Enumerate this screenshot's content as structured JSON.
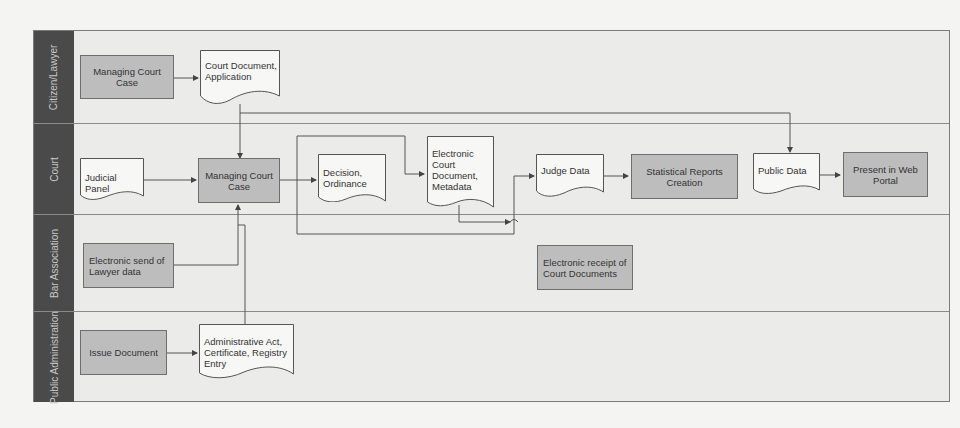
{
  "diagram": {
    "colors": {
      "lane_header": "#4a4a4a",
      "lane_bg": "#ebebea",
      "process_fill": "#bdbdbd",
      "document_fill": "#f7f7f6",
      "line": "#555555"
    },
    "lanes": [
      {
        "id": "citizen",
        "label": "Citizen/Lawyer"
      },
      {
        "id": "court",
        "label": "Court"
      },
      {
        "id": "bar",
        "label": "Bar Association"
      },
      {
        "id": "public_admin",
        "label": "Public Administration"
      }
    ],
    "nodes": {
      "citizen_managing": {
        "label": "Managing Court Case",
        "type": "process",
        "lane": "citizen"
      },
      "court_doc_application": {
        "label": "Court Document, Application",
        "type": "document",
        "lane": "citizen"
      },
      "judicial_panel": {
        "label": "Judicial Panel",
        "type": "document",
        "lane": "court"
      },
      "court_managing": {
        "label": "Managing Court Case",
        "type": "process",
        "lane": "court"
      },
      "decision_ordinance": {
        "label": "Decision, Ordinance",
        "type": "document",
        "lane": "court"
      },
      "electronic_court_doc": {
        "label": "Electronic Court Document, Metadata",
        "type": "document",
        "lane": "court"
      },
      "judge_data": {
        "label": "Judge Data",
        "type": "document",
        "lane": "court"
      },
      "statistical_reports": {
        "label": "Statistical Reports Creation",
        "type": "process",
        "lane": "court"
      },
      "public_data": {
        "label": "Public Data",
        "type": "document",
        "lane": "court"
      },
      "present_web_portal": {
        "label": "Present in Web Portal",
        "type": "process",
        "lane": "court"
      },
      "electronic_send_lawyer": {
        "label": "Electronic send of Lawyer data",
        "type": "process",
        "lane": "bar"
      },
      "electronic_receipt": {
        "label": "Electronic receipt of Court Documents",
        "type": "process",
        "lane": "bar"
      },
      "issue_document": {
        "label": "Issue Document",
        "type": "process",
        "lane": "public_admin"
      },
      "admin_act": {
        "label": "Administrative Act, Certificate, Registry Entry",
        "type": "document",
        "lane": "public_admin"
      }
    },
    "edges": [
      {
        "from": "citizen_managing",
        "to": "court_doc_application"
      },
      {
        "from": "court_doc_application",
        "to": "court_managing"
      },
      {
        "from": "court_doc_application",
        "to": "public_data"
      },
      {
        "from": "judicial_panel",
        "to": "court_managing"
      },
      {
        "from": "court_managing",
        "to": "decision_ordinance"
      },
      {
        "from": "court_managing",
        "to": "electronic_court_doc"
      },
      {
        "from": "court_managing",
        "to": "judge_data"
      },
      {
        "from": "judge_data",
        "to": "statistical_reports"
      },
      {
        "from": "public_data",
        "to": "present_web_portal"
      },
      {
        "from": "electronic_court_doc",
        "to": "electronic_receipt"
      },
      {
        "from": "electronic_send_lawyer",
        "to": "court_managing"
      },
      {
        "from": "admin_act",
        "to": "court_managing"
      },
      {
        "from": "issue_document",
        "to": "admin_act"
      }
    ]
  }
}
